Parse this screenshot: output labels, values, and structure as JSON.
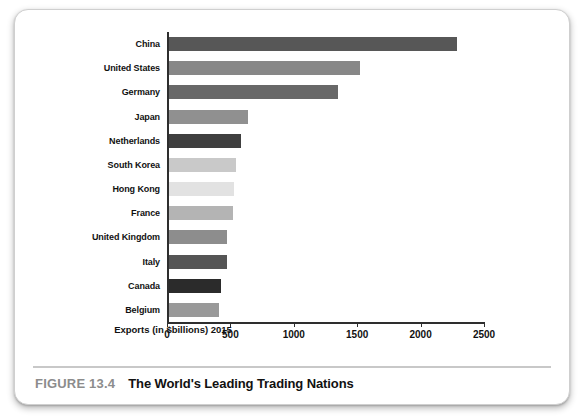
{
  "figure": {
    "number_label": "FIGURE 13.4",
    "title": "The World's Leading Trading Nations"
  },
  "chart_data": {
    "type": "bar",
    "orientation": "horizontal",
    "title": "The World's Leading Trading Nations",
    "xlabel": "Exports (in $billions) 2015",
    "ylabel": "",
    "xlim": [
      0,
      2500
    ],
    "xticks": [
      0,
      500,
      1000,
      1500,
      2000,
      2500
    ],
    "xtick_labels": [
      "0",
      "500",
      "1000",
      "1500",
      "2000",
      "2500"
    ],
    "grid": false,
    "legend": false,
    "categories": [
      "China",
      "United States",
      "Germany",
      "Japan",
      "Netherlands",
      "South Korea",
      "Hong Kong",
      "France",
      "United Kingdom",
      "Italy",
      "Canada",
      "Belgium"
    ],
    "values": [
      2275,
      1505,
      1330,
      625,
      565,
      527,
      511,
      506,
      460,
      459,
      408,
      398
    ],
    "bar_colors": [
      "#575757",
      "#878787",
      "#686868",
      "#909090",
      "#3f3f3f",
      "#c9c9c9",
      "#e2e2e2",
      "#b4b4b4",
      "#8d8d8d",
      "#555555",
      "#2b2b2b",
      "#999999"
    ],
    "bars": [
      {
        "category": "China",
        "value": 2275,
        "color": "#575757"
      },
      {
        "category": "United States",
        "value": 1505,
        "color": "#878787"
      },
      {
        "category": "Germany",
        "value": 1330,
        "color": "#686868"
      },
      {
        "category": "Japan",
        "value": 625,
        "color": "#909090"
      },
      {
        "category": "Netherlands",
        "value": 565,
        "color": "#3f3f3f"
      },
      {
        "category": "South Korea",
        "value": 527,
        "color": "#c9c9c9"
      },
      {
        "category": "Hong Kong",
        "value": 511,
        "color": "#e2e2e2"
      },
      {
        "category": "France",
        "value": 506,
        "color": "#b4b4b4"
      },
      {
        "category": "United Kingdom",
        "value": 460,
        "color": "#8d8d8d"
      },
      {
        "category": "Italy",
        "value": 459,
        "color": "#555555"
      },
      {
        "category": "Canada",
        "value": 408,
        "color": "#2b2b2b"
      },
      {
        "category": "Belgium",
        "value": 398,
        "color": "#999999"
      }
    ]
  },
  "colors": {
    "axis": "#2e2e2e",
    "caption_number": "#8c8c8c",
    "caption_title": "#111111",
    "card_border": "#cfcfcf"
  }
}
